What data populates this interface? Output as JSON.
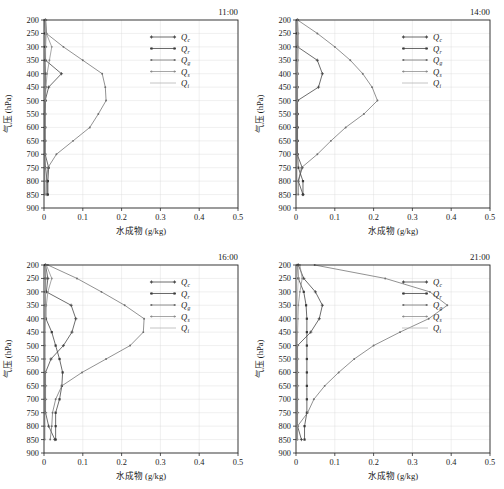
{
  "figure": {
    "axis": {
      "xlabel": "水成物 (g/kg)",
      "ylabel": "气压 (hPa)",
      "xticks": [
        "0",
        "0.1",
        "0.2",
        "0.3",
        "0.4",
        "0.5"
      ],
      "yticks": [
        "200",
        "250",
        "300",
        "350",
        "400",
        "450",
        "500",
        "550",
        "600",
        "650",
        "700",
        "750",
        "800",
        "850",
        "900"
      ],
      "xlim": [
        0,
        0.5
      ],
      "ylim": [
        200,
        900
      ]
    },
    "legend": [
      {
        "label": "Q",
        "sub": "c",
        "color": "#3c3c3c",
        "marker": "cross"
      },
      {
        "label": "Q",
        "sub": "r",
        "color": "#3a3a3a",
        "marker": "square"
      },
      {
        "label": "Q",
        "sub": "g",
        "color": "#6e6e6e",
        "marker": "dot"
      },
      {
        "label": "Q",
        "sub": "s",
        "color": "#8a8a8a",
        "marker": "dot"
      },
      {
        "label": "Q",
        "sub": "i",
        "color": "#b0b0b0",
        "marker": "none"
      }
    ],
    "panels": [
      {
        "time": "11:00"
      },
      {
        "time": "14:00"
      },
      {
        "time": "16:00"
      },
      {
        "time": "21:00"
      }
    ]
  },
  "chart_data": [
    {
      "type": "line",
      "title": "11:00",
      "xlabel": "水成物 (g/kg)",
      "ylabel": "气压 (hPa)",
      "xlim": [
        0,
        0.5
      ],
      "ylim": [
        200,
        900
      ],
      "y_inverted": true,
      "grid": true,
      "legend_position": "upper-right",
      "pressure_levels": [
        200,
        250,
        300,
        350,
        400,
        450,
        500,
        550,
        600,
        650,
        700,
        750,
        800,
        850
      ],
      "series": [
        {
          "name": "Qc",
          "values": [
            0.004,
            0.005,
            0.004,
            0.004,
            0.045,
            0.012,
            0.003,
            0.002,
            0.002,
            0.002,
            0.002,
            0.004,
            0.008,
            0.008
          ]
        },
        {
          "name": "Qr",
          "values": [
            0.002,
            0.003,
            0.003,
            0.003,
            0.004,
            0.004,
            0.004,
            0.003,
            0.003,
            0.003,
            0.003,
            0.012,
            0.01,
            0.01
          ]
        },
        {
          "name": "Qg",
          "values": [
            0.004,
            0.006,
            0.05,
            0.1,
            0.15,
            0.158,
            0.16,
            0.14,
            0.118,
            0.075,
            0.032,
            0.01,
            0.006,
            0.005
          ]
        },
        {
          "name": "Qs",
          "values": [
            0.004,
            0.006,
            0.02,
            0.014,
            0.008,
            0.005,
            0.003,
            0.002,
            0.002,
            0.002,
            0.002,
            0.002,
            0.002,
            0.002
          ]
        },
        {
          "name": "Qi",
          "values": [
            0.003,
            0.004,
            0.004,
            0.003,
            0.002,
            0.002,
            0.002,
            0.002,
            0.002,
            0.002,
            0.002,
            0.002,
            0.002,
            0.002
          ]
        }
      ]
    },
    {
      "type": "line",
      "title": "14:00",
      "xlabel": "水成物 (g/kg)",
      "ylabel": "气压 (hPa)",
      "xlim": [
        0,
        0.5
      ],
      "ylim": [
        200,
        900
      ],
      "y_inverted": true,
      "grid": true,
      "legend_position": "upper-right",
      "pressure_levels": [
        200,
        250,
        300,
        350,
        400,
        450,
        500,
        550,
        600,
        650,
        700,
        750,
        800,
        850
      ],
      "series": [
        {
          "name": "Qc",
          "values": [
            0.004,
            0.004,
            0.004,
            0.055,
            0.068,
            0.058,
            0.004,
            0.003,
            0.003,
            0.003,
            0.003,
            0.016,
            0.006,
            0.018
          ]
        },
        {
          "name": "Qr",
          "values": [
            0.003,
            0.003,
            0.003,
            0.003,
            0.004,
            0.004,
            0.004,
            0.004,
            0.004,
            0.004,
            0.004,
            0.006,
            0.018,
            0.018
          ]
        },
        {
          "name": "Qg",
          "values": [
            0.004,
            0.055,
            0.1,
            0.14,
            0.172,
            0.196,
            0.21,
            0.175,
            0.128,
            0.09,
            0.055,
            0.014,
            0.006,
            0.006
          ]
        },
        {
          "name": "Qs",
          "values": [
            0.004,
            0.006,
            0.006,
            0.005,
            0.004,
            0.003,
            0.003,
            0.002,
            0.002,
            0.002,
            0.002,
            0.002,
            0.002,
            0.002
          ]
        },
        {
          "name": "Qi",
          "values": [
            0.003,
            0.004,
            0.003,
            0.003,
            0.002,
            0.002,
            0.002,
            0.002,
            0.002,
            0.002,
            0.002,
            0.002,
            0.002,
            0.002
          ]
        }
      ]
    },
    {
      "type": "line",
      "title": "16:00",
      "xlabel": "水成物 (g/kg)",
      "ylabel": "气压 (hPa)",
      "xlim": [
        0,
        0.5
      ],
      "ylim": [
        200,
        900
      ],
      "y_inverted": true,
      "grid": true,
      "legend_position": "upper-right",
      "pressure_levels": [
        200,
        250,
        300,
        350,
        400,
        450,
        500,
        550,
        600,
        650,
        700,
        750,
        800,
        850
      ],
      "series": [
        {
          "name": "Qc",
          "values": [
            0.004,
            0.01,
            0.006,
            0.07,
            0.082,
            0.072,
            0.05,
            0.018,
            0.004,
            0.004,
            0.004,
            0.004,
            0.012,
            0.028
          ]
        },
        {
          "name": "Qr",
          "values": [
            0.003,
            0.004,
            0.004,
            0.004,
            0.005,
            0.02,
            0.03,
            0.04,
            0.048,
            0.046,
            0.04,
            0.03,
            0.03,
            0.03
          ]
        },
        {
          "name": "Qg",
          "values": [
            0.01,
            0.085,
            0.148,
            0.208,
            0.258,
            0.256,
            0.222,
            0.16,
            0.098,
            0.046,
            0.03,
            0.022,
            0.02,
            0.016
          ]
        },
        {
          "name": "Qs",
          "values": [
            0.006,
            0.02,
            0.01,
            0.006,
            0.004,
            0.003,
            0.003,
            0.003,
            0.002,
            0.002,
            0.002,
            0.002,
            0.002,
            0.002
          ]
        },
        {
          "name": "Qi",
          "values": [
            0.004,
            0.005,
            0.004,
            0.003,
            0.002,
            0.002,
            0.002,
            0.002,
            0.002,
            0.002,
            0.002,
            0.002,
            0.002,
            0.002
          ]
        }
      ]
    },
    {
      "type": "line",
      "title": "21:00",
      "xlabel": "水成物 (g/kg)",
      "ylabel": "气压 (hPa)",
      "xlim": [
        0,
        0.5
      ],
      "ylim": [
        200,
        900
      ],
      "y_inverted": true,
      "grid": true,
      "legend_position": "upper-right",
      "pressure_levels": [
        200,
        250,
        300,
        350,
        400,
        450,
        500,
        550,
        600,
        650,
        700,
        750,
        800,
        850
      ],
      "series": [
        {
          "name": "Qc",
          "values": [
            0.006,
            0.02,
            0.05,
            0.068,
            0.06,
            0.038,
            0.004,
            0.004,
            0.004,
            0.004,
            0.004,
            0.004,
            0.004,
            0.014
          ]
        },
        {
          "name": "Qr",
          "values": [
            0.004,
            0.006,
            0.02,
            0.026,
            0.028,
            0.028,
            0.028,
            0.028,
            0.028,
            0.028,
            0.028,
            0.028,
            0.022,
            0.022
          ]
        },
        {
          "name": "Qg",
          "values": [
            0.048,
            0.23,
            0.345,
            0.39,
            0.342,
            0.268,
            0.2,
            0.15,
            0.11,
            0.074,
            0.046,
            0.03,
            0.004,
            0.004
          ]
        },
        {
          "name": "Qs",
          "values": [
            0.01,
            0.016,
            0.01,
            0.006,
            0.005,
            0.004,
            0.003,
            0.003,
            0.003,
            0.003,
            0.003,
            0.003,
            0.003,
            0.003
          ]
        },
        {
          "name": "Qi",
          "values": [
            0.005,
            0.006,
            0.004,
            0.003,
            0.003,
            0.002,
            0.002,
            0.002,
            0.002,
            0.002,
            0.002,
            0.002,
            0.002,
            0.002
          ]
        }
      ]
    }
  ]
}
